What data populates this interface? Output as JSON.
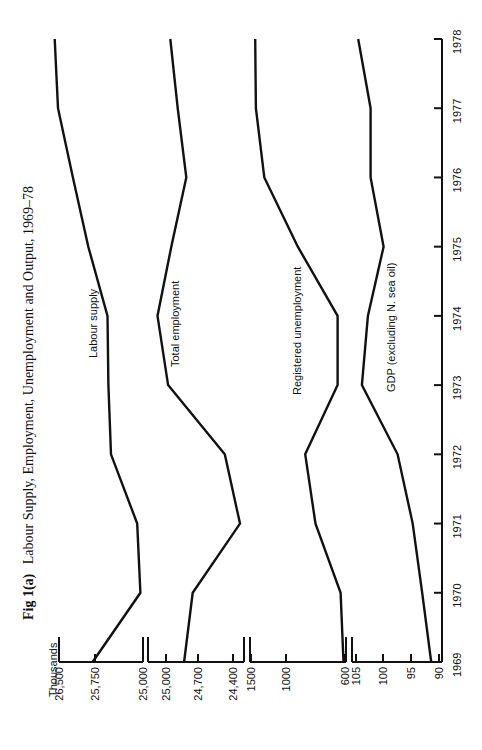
{
  "chart_data": {
    "type": "line",
    "title": "Fig 1(a)  Labour Supply, Employment, Unemployment and Output, 1969–78",
    "title_bold_part": "Fig 1(a)",
    "title_rest": "Labour Supply, Employment, Unemployment and Output, 1969–78",
    "orientation": "rotated 90° counter-clockwise (years run along right edge from bottom to top)",
    "units_label": "Thousands",
    "x": [
      1969,
      1970,
      1971,
      1972,
      1973,
      1974,
      1975,
      1976,
      1977,
      1978
    ],
    "x_tick_labels": [
      "1969",
      "1970",
      "1971",
      "1972",
      "1973",
      "1974",
      "1975",
      "1976",
      "1977",
      "1978"
    ],
    "grid": false,
    "legend": "inline labels beside each line",
    "panels": [
      {
        "name": "Labour supply",
        "unit": "thousands",
        "ylim": [
          25000,
          26500
        ],
        "tick_labels": [
          "26,500",
          "25,750",
          "25,000"
        ],
        "ticks": [
          26500,
          25750,
          25000
        ]
      },
      {
        "name": "Total employment",
        "unit": "thousands",
        "ylim": [
          24400,
          25000
        ],
        "tick_labels": [
          "25,000",
          "24,700",
          "24,400"
        ],
        "ticks": [
          25000,
          24700,
          24400
        ]
      },
      {
        "name": "Registered unemployment",
        "unit": "thousands",
        "ylim": [
          600,
          1500
        ],
        "tick_labels": [
          "1500",
          "1000",
          "600"
        ],
        "ticks": [
          1500,
          1000,
          600
        ]
      },
      {
        "name": "GDP (excluding N. sea oil)",
        "unit": "index",
        "ylim": [
          90,
          105
        ],
        "tick_labels": [
          "105",
          "100",
          "95",
          "90"
        ],
        "ticks": [
          105,
          100,
          95,
          90
        ]
      }
    ],
    "series": [
      {
        "name": "Labour supply",
        "values": [
          25800,
          25040,
          25090,
          25500,
          25540,
          25555,
          25890,
          26210,
          26520,
          26590
        ]
      },
      {
        "name": "Total employment",
        "values": [
          24830,
          24750,
          24340,
          24470,
          24980,
          25080,
          24950,
          24810,
          24890,
          24960
        ]
      },
      {
        "name": "Registered unemployment",
        "values": [
          610,
          630,
          800,
          870,
          650,
          650,
          920,
          1310,
          1430,
          1440
        ]
      },
      {
        "name": "GDP (excluding N. sea oil)",
        "values": [
          91.4,
          93.0,
          94.7,
          97.4,
          103.9,
          102.8,
          99.9,
          102.3,
          102.3,
          104.6
        ]
      }
    ]
  }
}
